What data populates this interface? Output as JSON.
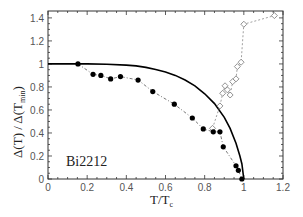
{
  "chart_data": {
    "type": "scatter",
    "title": "",
    "xlabel": "T/T",
    "xlabel_subscript": "c",
    "ylabel": "Δ(T) / Δ(T",
    "ylabel_subscript": "min",
    "ylabel_suffix": ")",
    "xlim": [
      0,
      1.2
    ],
    "ylim": [
      0,
      1.46
    ],
    "xticks": [
      0,
      0.2,
      0.4,
      0.6,
      0.8,
      1,
      1.2
    ],
    "xtick_labels": [
      "0",
      "0.2",
      "0.4",
      "0.6",
      "0.8",
      "1",
      "1.2"
    ],
    "yticks": [
      0,
      0.2,
      0.4,
      0.6,
      0.8,
      1,
      1.2,
      1.4
    ],
    "ytick_labels": [
      "0",
      "0.2",
      "0.4",
      "0.6",
      "0.8",
      "1",
      "1.2",
      "1.4"
    ],
    "grid": false,
    "legend": null,
    "annotations": [
      {
        "text": "Bi2212",
        "x": 0.09,
        "y": 0.16
      }
    ],
    "series": [
      {
        "name": "Gap (filled circles)",
        "marker": "filled-circle",
        "line": "dash-dot",
        "color": "#000000",
        "x": [
          0.153,
          0.23,
          0.27,
          0.32,
          0.37,
          0.46,
          0.535,
          0.645,
          0.737,
          0.793,
          0.844,
          0.878,
          0.895,
          0.96,
          0.972,
          0.99
        ],
        "y": [
          1.0,
          0.91,
          0.9,
          0.87,
          0.89,
          0.86,
          0.76,
          0.65,
          0.53,
          0.435,
          0.41,
          0.41,
          0.28,
          0.115,
          0.075,
          0.0
        ]
      },
      {
        "name": "Open diamonds",
        "marker": "open-diamond",
        "line": "dashed",
        "color": "#888888",
        "x": [
          0.84,
          0.878,
          0.892,
          0.904,
          0.916,
          0.93,
          0.943,
          0.96,
          0.967,
          0.986,
          1.0,
          1.156
        ],
        "y": [
          0.44,
          0.635,
          0.745,
          0.81,
          0.775,
          0.73,
          0.846,
          0.87,
          0.977,
          1.015,
          1.345,
          1.42
        ]
      },
      {
        "name": "BCS curve",
        "marker": "none",
        "line": "solid",
        "color": "#000000",
        "x": [
          0.0,
          0.1,
          0.2,
          0.3,
          0.4,
          0.45,
          0.5,
          0.55,
          0.6,
          0.65,
          0.7,
          0.75,
          0.8,
          0.85,
          0.9,
          0.93,
          0.96,
          0.98,
          0.99,
          1.0
        ],
        "y": [
          1.0,
          1.0,
          1.0,
          0.998,
          0.99,
          0.983,
          0.97,
          0.952,
          0.93,
          0.9,
          0.86,
          0.81,
          0.74,
          0.655,
          0.535,
          0.44,
          0.31,
          0.2,
          0.13,
          0.0
        ]
      }
    ]
  }
}
